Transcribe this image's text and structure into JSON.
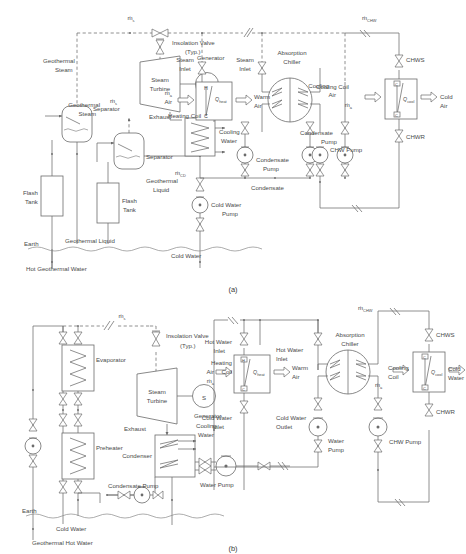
{
  "figure": {
    "caption_a": "(a)",
    "caption_b": "(b)",
    "type": "process-flow-diagram"
  },
  "diagram_a": {
    "flow_labels": {
      "steam_top": "ṁ",
      "steam_top_sub": "s",
      "steam_mid": "ṁ",
      "steam_mid_sub": "s",
      "chw": "ṁ",
      "chw_sub": "CHW",
      "cd": "ṁ",
      "cd_sub": "CD",
      "air_heating": "ṁ",
      "air_heating_sub": "a",
      "air_cooling": "ṁ",
      "air_cooling_sub": "a"
    },
    "labels": [
      "Insolation Valve",
      "(Typ.)",
      "Geothermal Steam",
      "Steam Turbine",
      "Generator",
      "Exhaust",
      "Separator",
      "Separator",
      "Flash Tank",
      "Flash Tank",
      "Geothermal Liquid",
      "Geothermal Liquid",
      "Earth",
      "Hot Geothermal Water",
      "Cold Water",
      "Cold Water Pump",
      "Cooling Water",
      "Condensate",
      "Condensate Pump",
      "Condensate Pump",
      "Steam Inlet",
      "Steam Inlet",
      "Heating Coil",
      "Air",
      "Warm Air",
      "Absorption Chiller",
      "Cooling Coil",
      "Cooling Air",
      "Cold Air",
      "CHWS",
      "CHWR",
      "CHW Pump"
    ],
    "coil_markers": {
      "hot": "H",
      "cold": "C",
      "q_heat": "Q",
      "q_heat_sub": "heat",
      "q_cool": "Q",
      "q_cool_sub": "cool"
    },
    "generator_symbol": "S"
  },
  "diagram_b": {
    "flow_labels": {
      "steam_top": "ṁ",
      "steam_top_sub": "s",
      "chw": "ṁ",
      "chw_sub": "CHW",
      "air_heating": "ṁ",
      "air_heating_sub": "a",
      "air_cooling": "ṁ",
      "air_cooling_sub": "a"
    },
    "labels": [
      "Insolation Valve",
      "(Typ.)",
      "Evaporator",
      "Preheater",
      "Steam Turbine",
      "Generator",
      "Exhaust",
      "Condenser",
      "Cooling Water",
      "Condensate Pump",
      "Water Pump",
      "Earth",
      "Cold Water",
      "Geothermal Hot Water",
      "Hot Water Inlet",
      "Hot Water Inlet",
      "Heating Coil",
      "Air",
      "Warm Air",
      "Cold Water Inlet",
      "Cold Water Outlet",
      "Absorption Chiller",
      "Cooling Coil",
      "Cooling Air",
      "Cold Water",
      "CHWS",
      "CHWR",
      "Water Pump",
      "CHW Pump"
    ],
    "coil_markers": {
      "hot": "H",
      "cold": "C",
      "q_heat": "Q",
      "q_heat_sub": "heat",
      "q_cool": "Q",
      "q_cool_sub": "cool"
    },
    "generator_symbol": "S"
  },
  "colors": {
    "line": "#6b6b6b",
    "text": "#4a4a4a",
    "background": "#ffffff"
  }
}
